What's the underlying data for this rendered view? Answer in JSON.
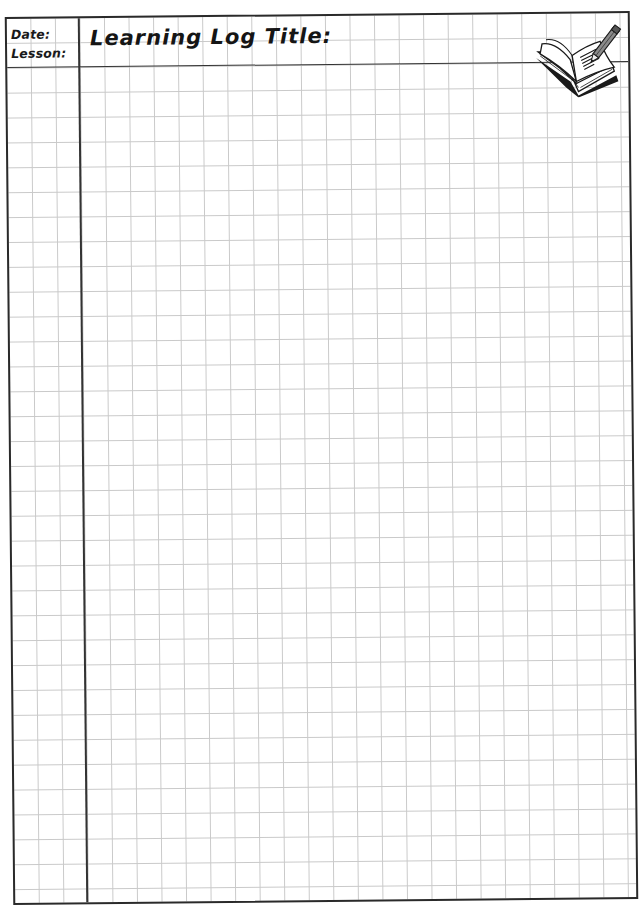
{
  "worksheet": {
    "type": "learning-log",
    "header": {
      "date_label": "Date:",
      "lesson_label": "Lesson:",
      "title_label": "Learning Log Title:"
    },
    "icon": "open-book-with-pencil-icon",
    "grid": {
      "style": "graph-paper",
      "line_color": "#c9c9c9",
      "border_color": "#2a2a2a",
      "left_column_cells": 3,
      "header_rows": 2
    }
  }
}
